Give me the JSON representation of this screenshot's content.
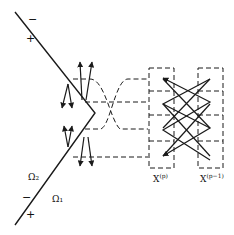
{
  "figure": {
    "type": "schematic diagram",
    "signs": {
      "upper_minus": "−",
      "upper_plus": "+",
      "lower_minus": "−",
      "lower_plus": "+"
    },
    "regions": {
      "omega_2": "Ω₂",
      "omega_1": "Ω₁"
    },
    "columns": [
      {
        "label": "X",
        "superscript": "(p)"
      },
      {
        "label": "X",
        "superscript": "(p−1)"
      }
    ],
    "colors": {
      "stroke": "#1a1a1a",
      "background": "#ffffff"
    }
  }
}
